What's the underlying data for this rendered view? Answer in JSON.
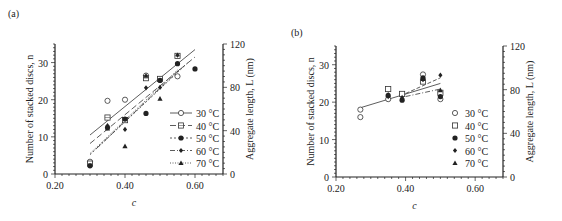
{
  "chart_data": [
    {
      "panel": "(a)",
      "type": "scatter",
      "xlabel": "c",
      "ylabel": "Number of stacked discs, n",
      "ylabel_right": "Aggregate length, L (nm)",
      "xlim": [
        0.2,
        0.68
      ],
      "ylim": [
        0,
        35
      ],
      "ylim_right": [
        0,
        120
      ],
      "xticks": [
        "0.20",
        "0.40",
        "0.60"
      ],
      "yticks": [
        "0",
        "10",
        "20",
        "30"
      ],
      "yticks_right": [
        "0",
        "40",
        "80",
        "120"
      ],
      "legend_position": "lower right",
      "series": [
        {
          "name": "30 °C",
          "marker": "open-circle",
          "line": "solid",
          "x": [
            0.3,
            0.35,
            0.4,
            0.46,
            0.5,
            0.55
          ],
          "y": [
            3.3,
            19.7,
            20.0,
            26.5,
            25.5,
            26.3
          ],
          "fit": [
            [
              0.3,
              10.5
            ],
            [
              0.6,
              33.5
            ]
          ]
        },
        {
          "name": "40 °C",
          "marker": "dotted-square",
          "line": "long-dash",
          "x": [
            0.3,
            0.35,
            0.4,
            0.46,
            0.5,
            0.55
          ],
          "y": [
            2.8,
            15.2,
            14.5,
            25.8,
            25.6,
            31.8
          ],
          "fit": [
            [
              0.3,
              8.2
            ],
            [
              0.6,
              31.5
            ]
          ]
        },
        {
          "name": "50 °C",
          "marker": "filled-circle",
          "line": "short-dash",
          "x": [
            0.3,
            0.35,
            0.4,
            0.46,
            0.5,
            0.55,
            0.6
          ],
          "y": [
            2.2,
            12.5,
            14.8,
            16.3,
            25.2,
            29.7,
            28.3
          ],
          "fit": [
            [
              0.3,
              5.2
            ],
            [
              0.58,
              30.0
            ]
          ]
        },
        {
          "name": "60 °C",
          "marker": "filled-diamond",
          "line": "dash-dot",
          "x": [
            0.35,
            0.4,
            0.46,
            0.5,
            0.55
          ],
          "y": [
            13.0,
            12.0,
            23.2,
            23.3,
            32.0
          ],
          "fit": [
            [
              0.32,
              7.0
            ],
            [
              0.56,
              28.5
            ]
          ]
        },
        {
          "name": "70 °C",
          "marker": "filled-triangle",
          "line": "dotted",
          "x": [
            0.35,
            0.4,
            0.46,
            0.5
          ],
          "y": [
            12.3,
            7.5,
            26.5,
            20.3
          ],
          "fit": [
            [
              0.3,
              5.5
            ],
            [
              0.55,
              28.0
            ]
          ]
        }
      ]
    },
    {
      "panel": "(b)",
      "type": "scatter",
      "xlabel": "c",
      "ylabel": "Number of stacked discs, n",
      "ylabel_right": "Aggregate length, L (nm)",
      "xlim": [
        0.2,
        0.68
      ],
      "ylim": [
        0,
        35
      ],
      "ylim_right": [
        0,
        120
      ],
      "xticks": [
        "0.20",
        "0.40",
        "0.60"
      ],
      "yticks": [
        "0",
        "10",
        "20",
        "30"
      ],
      "yticks_right": [
        "0",
        "40",
        "80",
        "120"
      ],
      "legend_position": "lower right",
      "series": [
        {
          "name": "30 °C",
          "marker": "open-circle",
          "x": [
            0.27,
            0.27,
            0.35,
            0.39,
            0.45,
            0.5
          ],
          "y": [
            16.0,
            18.0,
            20.8,
            22.0,
            27.4,
            20.8
          ]
        },
        {
          "name": "40 °C",
          "marker": "open-square",
          "x": [
            0.35,
            0.39,
            0.45,
            0.5
          ],
          "y": [
            23.5,
            22.2,
            25.5,
            22.5
          ]
        },
        {
          "name": "50 °C",
          "marker": "filled-circle",
          "x": [
            0.35,
            0.39,
            0.45,
            0.5
          ],
          "y": [
            21.8,
            20.5,
            26.5,
            21.5
          ]
        },
        {
          "name": "60 °C",
          "marker": "filled-diamond",
          "x": [
            0.35,
            0.39,
            0.45,
            0.5
          ],
          "y": [
            21.5,
            21.0,
            26.0,
            27.2
          ]
        },
        {
          "name": "70 °C",
          "marker": "filled-triangle",
          "x": [
            0.35,
            0.39,
            0.45,
            0.5
          ],
          "y": [
            22.0,
            21.3,
            26.2,
            23.2
          ]
        }
      ],
      "fit_lines": [
        {
          "style": "solid",
          "points": [
            [
              0.27,
              18.5
            ],
            [
              0.5,
              25.0
            ]
          ]
        },
        {
          "style": "dashed",
          "points": [
            [
              0.4,
              22.3
            ],
            [
              0.5,
              26.5
            ]
          ]
        },
        {
          "style": "dash-dot",
          "points": [
            [
              0.4,
              21.5
            ],
            [
              0.5,
              23.5
            ]
          ]
        }
      ]
    }
  ]
}
